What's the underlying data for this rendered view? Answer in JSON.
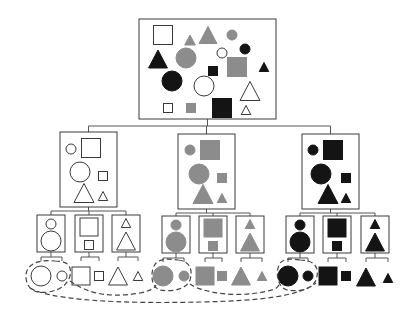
{
  "diagram": {
    "type": "hierarchical-decomposition-tree",
    "colors": {
      "white": "#ffffff",
      "gray": "#8c8c8c",
      "black": "#141414",
      "stroke": "#3a3a3a",
      "line": "#555555",
      "dash": "#444444"
    },
    "root": {
      "label": "all-shapes",
      "box": {
        "x": 139,
        "y": 19,
        "w": 137,
        "h": 100
      },
      "shapes": [
        {
          "kind": "square",
          "fill": "white",
          "cx": 163,
          "cy": 35,
          "size": 19
        },
        {
          "kind": "triangle",
          "fill": "gray",
          "cx": 190,
          "cy": 40,
          "size": 10
        },
        {
          "kind": "triangle",
          "fill": "gray",
          "cx": 208,
          "cy": 35,
          "size": 17
        },
        {
          "kind": "circle",
          "fill": "gray",
          "cx": 232,
          "cy": 35,
          "r": 5
        },
        {
          "kind": "circle",
          "fill": "black",
          "cx": 245,
          "cy": 49,
          "r": 5
        },
        {
          "kind": "triangle",
          "fill": "black",
          "cx": 158,
          "cy": 59,
          "size": 18
        },
        {
          "kind": "circle",
          "fill": "gray",
          "cx": 186,
          "cy": 58,
          "r": 10
        },
        {
          "kind": "circle",
          "fill": "white",
          "cx": 222,
          "cy": 53,
          "r": 5
        },
        {
          "kind": "square",
          "fill": "gray",
          "cx": 237,
          "cy": 67,
          "size": 19
        },
        {
          "kind": "triangle",
          "fill": "black",
          "cx": 264,
          "cy": 67,
          "size": 9
        },
        {
          "kind": "square",
          "fill": "black",
          "cx": 213,
          "cy": 71,
          "size": 9
        },
        {
          "kind": "circle",
          "fill": "black",
          "cx": 172,
          "cy": 81,
          "r": 10
        },
        {
          "kind": "circle",
          "fill": "white",
          "cx": 204,
          "cy": 86,
          "r": 10
        },
        {
          "kind": "triangle",
          "fill": "white",
          "cx": 250,
          "cy": 91,
          "size": 19
        },
        {
          "kind": "square",
          "fill": "white",
          "cx": 168,
          "cy": 108,
          "size": 9
        },
        {
          "kind": "square",
          "fill": "gray",
          "cx": 191,
          "cy": 108,
          "size": 9
        },
        {
          "kind": "square",
          "fill": "black",
          "cx": 222,
          "cy": 108,
          "size": 19
        },
        {
          "kind": "triangle",
          "fill": "white",
          "cx": 246,
          "cy": 110,
          "size": 9
        }
      ]
    },
    "level2": [
      {
        "label": "white-group",
        "box": {
          "x": 60,
          "y": 132,
          "w": 57,
          "h": 75
        },
        "shapes": [
          {
            "kind": "circle",
            "fill": "white",
            "cx": 71,
            "cy": 149,
            "r": 5
          },
          {
            "kind": "square",
            "fill": "white",
            "cx": 91,
            "cy": 148,
            "size": 19
          },
          {
            "kind": "circle",
            "fill": "white",
            "cx": 80,
            "cy": 172,
            "r": 10
          },
          {
            "kind": "square",
            "fill": "white",
            "cx": 103,
            "cy": 176,
            "size": 9
          },
          {
            "kind": "triangle",
            "fill": "white",
            "cx": 84,
            "cy": 193,
            "size": 19
          },
          {
            "kind": "triangle",
            "fill": "white",
            "cx": 103,
            "cy": 196,
            "size": 9
          }
        ]
      },
      {
        "label": "gray-group",
        "box": {
          "x": 178,
          "y": 134,
          "w": 57,
          "h": 75
        },
        "shapes": [
          {
            "kind": "circle",
            "fill": "gray",
            "cx": 190,
            "cy": 150,
            "r": 5
          },
          {
            "kind": "square",
            "fill": "gray",
            "cx": 210,
            "cy": 150,
            "size": 19
          },
          {
            "kind": "circle",
            "fill": "gray",
            "cx": 199,
            "cy": 174,
            "r": 10
          },
          {
            "kind": "square",
            "fill": "gray",
            "cx": 222,
            "cy": 178,
            "size": 9
          },
          {
            "kind": "triangle",
            "fill": "gray",
            "cx": 203,
            "cy": 194,
            "size": 19
          },
          {
            "kind": "triangle",
            "fill": "gray",
            "cx": 222,
            "cy": 198,
            "size": 9
          }
        ]
      },
      {
        "label": "black-group",
        "box": {
          "x": 302,
          "y": 134,
          "w": 57,
          "h": 75
        },
        "shapes": [
          {
            "kind": "circle",
            "fill": "black",
            "cx": 313,
            "cy": 150,
            "r": 5
          },
          {
            "kind": "square",
            "fill": "black",
            "cx": 333,
            "cy": 150,
            "size": 19
          },
          {
            "kind": "circle",
            "fill": "black",
            "cx": 321,
            "cy": 174,
            "r": 10
          },
          {
            "kind": "square",
            "fill": "black",
            "cx": 346,
            "cy": 178,
            "size": 9
          },
          {
            "kind": "triangle",
            "fill": "black",
            "cx": 328,
            "cy": 194,
            "size": 19
          },
          {
            "kind": "triangle",
            "fill": "black",
            "cx": 346,
            "cy": 198,
            "size": 9
          }
        ]
      }
    ],
    "level3": [
      {
        "label": "white-circles",
        "parent": 0,
        "box": {
          "x": 37,
          "y": 215,
          "w": 28,
          "h": 37
        },
        "kind": "circle",
        "fill": "white"
      },
      {
        "label": "white-squares",
        "parent": 0,
        "box": {
          "x": 75,
          "y": 215,
          "w": 28,
          "h": 37
        },
        "kind": "square",
        "fill": "white"
      },
      {
        "label": "white-triangles",
        "parent": 0,
        "box": {
          "x": 112,
          "y": 215,
          "w": 28,
          "h": 37
        },
        "kind": "triangle",
        "fill": "white"
      },
      {
        "label": "gray-circles",
        "parent": 1,
        "box": {
          "x": 162,
          "y": 216,
          "w": 28,
          "h": 37
        },
        "kind": "circle",
        "fill": "gray"
      },
      {
        "label": "gray-squares",
        "parent": 1,
        "box": {
          "x": 199,
          "y": 216,
          "w": 28,
          "h": 37
        },
        "kind": "square",
        "fill": "gray"
      },
      {
        "label": "gray-triangles",
        "parent": 1,
        "box": {
          "x": 236,
          "y": 216,
          "w": 28,
          "h": 37
        },
        "kind": "triangle",
        "fill": "gray"
      },
      {
        "label": "black-circles",
        "parent": 2,
        "box": {
          "x": 286,
          "y": 216,
          "w": 28,
          "h": 37
        },
        "kind": "circle",
        "fill": "black"
      },
      {
        "label": "black-squares",
        "parent": 2,
        "box": {
          "x": 323,
          "y": 216,
          "w": 28,
          "h": 37
        },
        "kind": "square",
        "fill": "black"
      },
      {
        "label": "black-triangles",
        "parent": 2,
        "box": {
          "x": 361,
          "y": 216,
          "w": 28,
          "h": 37
        },
        "kind": "triangle",
        "fill": "black"
      }
    ],
    "leaves": [
      {
        "parent": 0,
        "kind": "circle",
        "fill": "white",
        "cx": 41,
        "cy": 276,
        "big": true
      },
      {
        "parent": 0,
        "kind": "circle",
        "fill": "white",
        "cx": 62,
        "cy": 276,
        "big": false
      },
      {
        "parent": 1,
        "kind": "square",
        "fill": "white",
        "cx": 81,
        "cy": 276,
        "big": true
      },
      {
        "parent": 1,
        "kind": "square",
        "fill": "white",
        "cx": 99,
        "cy": 276,
        "big": false
      },
      {
        "parent": 2,
        "kind": "triangle",
        "fill": "white",
        "cx": 118,
        "cy": 276,
        "big": true
      },
      {
        "parent": 2,
        "kind": "triangle",
        "fill": "white",
        "cx": 138,
        "cy": 276,
        "big": false
      },
      {
        "parent": 3,
        "kind": "circle",
        "fill": "gray",
        "cx": 163,
        "cy": 276,
        "big": true
      },
      {
        "parent": 3,
        "kind": "circle",
        "fill": "gray",
        "cx": 184,
        "cy": 276,
        "big": false
      },
      {
        "parent": 4,
        "kind": "square",
        "fill": "gray",
        "cx": 205,
        "cy": 276,
        "big": true
      },
      {
        "parent": 4,
        "kind": "square",
        "fill": "gray",
        "cx": 222,
        "cy": 276,
        "big": false
      },
      {
        "parent": 5,
        "kind": "triangle",
        "fill": "gray",
        "cx": 241,
        "cy": 276,
        "big": true
      },
      {
        "parent": 5,
        "kind": "triangle",
        "fill": "gray",
        "cx": 262,
        "cy": 276,
        "big": false
      },
      {
        "parent": 6,
        "kind": "circle",
        "fill": "black",
        "cx": 288,
        "cy": 276,
        "big": true
      },
      {
        "parent": 6,
        "kind": "circle",
        "fill": "black",
        "cx": 308,
        "cy": 276,
        "big": false
      },
      {
        "parent": 7,
        "kind": "square",
        "fill": "black",
        "cx": 328,
        "cy": 276,
        "big": true
      },
      {
        "parent": 7,
        "kind": "square",
        "fill": "black",
        "cx": 346,
        "cy": 276,
        "big": false
      },
      {
        "parent": 8,
        "kind": "triangle",
        "fill": "black",
        "cx": 366,
        "cy": 277,
        "big": true
      },
      {
        "parent": 8,
        "kind": "triangle",
        "fill": "black",
        "cx": 388,
        "cy": 278,
        "big": false
      }
    ],
    "dashed_loops": [
      {
        "label": "white-circles-loop",
        "d": "M 55 261 C 68 261, 72 266, 70 276 C 68 283, 62 290, 48 292 C 35 294, 27 289, 26 278 C 25 266, 35 259, 55 261 Z"
      },
      {
        "label": "gray-circles-loop",
        "d": "M 178 260 C 190 261, 193 270, 190 280 C 186 290, 170 292, 160 290 C 150 287, 150 270, 156 263 C 162 258, 170 259, 178 260 Z"
      },
      {
        "label": "black-circles-loop",
        "d": "M 300 260 C 315 260, 320 268, 316 280 C 312 290, 298 292, 287 290 C 277 287, 275 272, 280 263 C 285 258, 292 259, 300 260 Z"
      },
      {
        "label": "white-to-gray-link",
        "d": "M 70 281 C 80 288, 100 300, 140 293 C 150 291, 155 288, 156 285"
      },
      {
        "label": "gray-to-black-link",
        "d": "M 190 284 C 200 292, 240 300, 275 289 C 278 287, 279 285, 280 283"
      },
      {
        "label": "outer-circles-link",
        "d": "M 30 288 C 50 300, 120 304, 200 302 C 260 301, 300 296, 316 283"
      }
    ]
  }
}
